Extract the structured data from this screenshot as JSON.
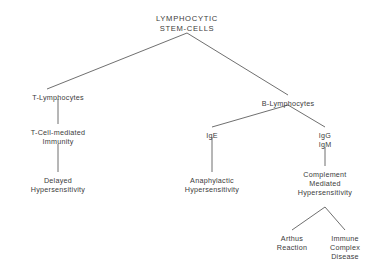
{
  "diagram": {
    "background_color": "#ffffff",
    "text_color": "#3b3b3b",
    "edge_color": "#4a4a4a",
    "nodes": [
      {
        "id": "lymphocytic-stem-cells",
        "lines": [
          "LYMPHOCYTIC",
          "STEM-CELLS"
        ],
        "x": 187,
        "y": 14
      },
      {
        "id": "t-lymphocytes",
        "lines": [
          "T-Lymphocytes"
        ],
        "x": 58,
        "y": 93
      },
      {
        "id": "t-cell-mediated-immunity",
        "lines": [
          "T-Cell-mediated",
          "Immunity"
        ],
        "x": 58,
        "y": 128
      },
      {
        "id": "delayed-hypersensitivity",
        "lines": [
          "Delayed",
          "Hypersensitivity"
        ],
        "x": 58,
        "y": 176
      },
      {
        "id": "b-lymphocytes",
        "lines": [
          "B-Lymphocytes"
        ],
        "x": 288,
        "y": 99
      },
      {
        "id": "ige",
        "lines": [
          "IgE"
        ],
        "x": 212,
        "y": 131
      },
      {
        "id": "igg-igm",
        "lines": [
          "IgG",
          "IgM"
        ],
        "x": 325,
        "y": 131
      },
      {
        "id": "anaphylactic-hypersensitivity",
        "lines": [
          "Anaphylactic",
          "Hypersensitivity"
        ],
        "x": 212,
        "y": 176
      },
      {
        "id": "complement-mediated-hypersensitivity",
        "lines": [
          "Complement",
          "Mediated",
          "Hypersensitivity"
        ],
        "x": 325,
        "y": 170
      },
      {
        "id": "arthus-reaction",
        "lines": [
          "Arthus",
          "Reaction"
        ],
        "x": 292,
        "y": 234
      },
      {
        "id": "immune-complex-disease",
        "lines": [
          "Immune",
          "Complex",
          "Disease"
        ],
        "x": 345,
        "y": 234
      }
    ],
    "edges": [
      {
        "id": "edge-root-to-t-lymphocytes",
        "x1": 187,
        "y1": 33,
        "x2": 47,
        "y2": 89
      },
      {
        "id": "edge-root-to-b-lymphocytes",
        "x1": 187,
        "y1": 33,
        "x2": 288,
        "y2": 95
      },
      {
        "id": "edge-t-lymphocytes-to-t-cell-mediated",
        "x1": 58,
        "y1": 99,
        "x2": 58,
        "y2": 124
      },
      {
        "id": "edge-t-cell-mediated-to-delayed",
        "x1": 58,
        "y1": 144,
        "x2": 58,
        "y2": 172
      },
      {
        "id": "edge-b-lymphocytes-to-ige",
        "x1": 288,
        "y1": 105,
        "x2": 212,
        "y2": 127
      },
      {
        "id": "edge-b-lymphocytes-to-igg-igm",
        "x1": 288,
        "y1": 105,
        "x2": 325,
        "y2": 127
      },
      {
        "id": "edge-ige-to-anaphylactic",
        "x1": 212,
        "y1": 137,
        "x2": 212,
        "y2": 172
      },
      {
        "id": "edge-igg-igm-to-complement",
        "x1": 325,
        "y1": 147,
        "x2": 325,
        "y2": 166
      },
      {
        "id": "edge-complement-to-arthus",
        "x1": 325,
        "y1": 207,
        "x2": 292,
        "y2": 230
      },
      {
        "id": "edge-complement-to-immune-complex",
        "x1": 325,
        "y1": 207,
        "x2": 345,
        "y2": 230
      }
    ]
  }
}
